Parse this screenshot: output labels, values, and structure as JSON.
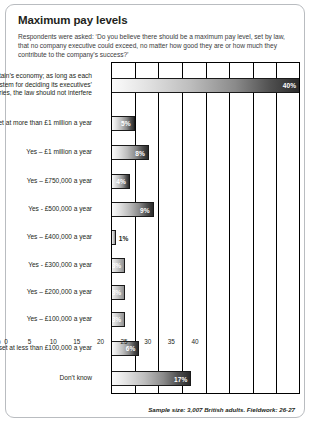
{
  "card": {
    "title": "Maximum pay levels",
    "subtitle": "Respondents were asked: ‘Do you believe there should be a maximum pay level, set by law, that no company executive could exceed, no matter how good they are or how much they contribute to the company’s success?’",
    "footer": "Sample size: 3,007 British adults. Fieldwork: 26-27"
  },
  "axis": {
    "unit": "%",
    "ticks": [
      "0",
      "5",
      "10",
      "15",
      "20",
      "25",
      "30",
      "35",
      "40"
    ]
  },
  "chart_data": {
    "type": "bar",
    "orientation": "horizontal",
    "title": "Maximum pay levels",
    "subtitle": "Respondents were asked: ‘Do you believe there should be a maximum pay level, set by law, that no company executive could exceed, no matter how good they are or how much they contribute to the company’s success?’",
    "xlabel": "%",
    "ylabel": "",
    "xlim": [
      0,
      40
    ],
    "xticks": [
      0,
      5,
      10,
      15,
      20,
      25,
      30,
      35,
      40
    ],
    "grid": true,
    "legend": false,
    "value_suffix": "%",
    "categories": [
      "No - this would be bad for Britain’s economy; as long as each company has a fair system for deciding its executives’ salaries, the law should not interfere",
      "Yes - the limit should be set at more than £1 million a year",
      "Yes – £1 million a year",
      "Yes – £750,000 a year",
      "Yes - £500,000 a year",
      "Yes – £400,000 a year",
      "Yes - £300,000 a year",
      "Yes – £200,000 a year",
      "Yes – £100,000 a year",
      "Yes – the limit should be set at less than £100,000 a year",
      "Don’t know"
    ],
    "values": [
      40,
      5,
      8,
      4,
      9,
      1,
      3,
      3,
      3,
      6,
      17
    ],
    "value_labels": [
      "40%",
      "5%",
      "8%",
      "4%",
      "9%",
      "1%",
      "3%",
      "3%",
      "3%",
      "6%",
      "17%"
    ]
  },
  "rows": [
    {
      "label": "No - this would be bad for Britain’s economy; as long as each company has a fair system for deciding its executives’ salaries, the law should not interfere",
      "value": 40,
      "value_label": "40%",
      "label_inside": true
    },
    {
      "label": "Yes - the limit should be set at more than £1 million a year",
      "value": 5,
      "value_label": "5%",
      "label_inside": true
    },
    {
      "label": "Yes – £1 million a year",
      "value": 8,
      "value_label": "8%",
      "label_inside": true
    },
    {
      "label": "Yes – £750,000 a year",
      "value": 4,
      "value_label": "4%",
      "label_inside": true
    },
    {
      "label": "Yes - £500,000 a year",
      "value": 9,
      "value_label": "9%",
      "label_inside": true
    },
    {
      "label": "Yes – £400,000 a year",
      "value": 1,
      "value_label": "1%",
      "label_inside": false
    },
    {
      "label": "Yes - £300,000 a year",
      "value": 3,
      "value_label": "3%",
      "label_inside": true
    },
    {
      "label": "Yes – £200,000 a year",
      "value": 3,
      "value_label": "3%",
      "label_inside": true
    },
    {
      "label": "Yes – £100,000 a year",
      "value": 3,
      "value_label": "3%",
      "label_inside": true
    },
    {
      "label": "Yes – the limit should be set at less than £100,000 a year",
      "value": 6,
      "value_label": "6%",
      "label_inside": true
    },
    {
      "label": "Don’t know",
      "value": 17,
      "value_label": "17%",
      "label_inside": true
    }
  ]
}
